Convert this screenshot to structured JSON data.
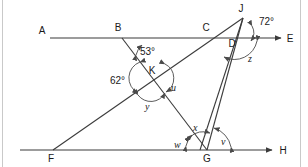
{
  "figure": {
    "points": [
      {
        "name": "A",
        "label": "A",
        "x": 42,
        "y": 38,
        "label_x": 42,
        "label_y": 34
      },
      {
        "name": "B",
        "label": "B",
        "x": 122,
        "y": 38,
        "label_x": 118,
        "label_y": 31
      },
      {
        "name": "C",
        "label": "C",
        "x": 211,
        "y": 38,
        "label_x": 206,
        "label_y": 31
      },
      {
        "name": "D",
        "label": "D",
        "x": 237,
        "y": 38,
        "label_x": 232,
        "label_y": 45
      },
      {
        "name": "E",
        "label": "E",
        "x": 281,
        "y": 38,
        "label_x": 289,
        "label_y": 41
      },
      {
        "name": "J",
        "label": "J",
        "x": 243,
        "y": 18,
        "label_x": 241,
        "label_y": 11
      },
      {
        "name": "K",
        "label": "K",
        "x": 152,
        "y": 77,
        "label_x": 152,
        "label_y": 74
      },
      {
        "name": "F",
        "label": "F",
        "x": 53,
        "y": 150,
        "label_x": 51,
        "label_y": 161
      },
      {
        "name": "G",
        "label": "G",
        "x": 207,
        "y": 150,
        "label_x": 206,
        "label_y": 161
      },
      {
        "name": "H",
        "label": "H",
        "x": 272,
        "y": 150,
        "label_x": 282,
        "label_y": 153
      }
    ],
    "lines": [
      {
        "name": "line-AE",
        "from": "A",
        "to": "E",
        "arrow_end": true,
        "arrow_start": false
      },
      {
        "name": "line-FH",
        "from": "F",
        "to": "H",
        "arrow_end": true,
        "arrow_start": false
      },
      {
        "name": "segment-BG",
        "from": "B",
        "to": "G",
        "arrow_end": false,
        "arrow_start": false
      },
      {
        "name": "segment-FJ",
        "from": "F",
        "to": "J",
        "arrow_end": false,
        "arrow_start": false
      },
      {
        "name": "segment-JG",
        "from": "J",
        "to": "G",
        "arrow_end": false,
        "arrow_start": false
      },
      {
        "name": "segment-JD-G",
        "from": "J",
        "to": "G",
        "arrow_end": false,
        "arrow_start": false
      }
    ],
    "angles": [
      {
        "name": "angle-53-at-B",
        "label": "53°",
        "vertex": "B",
        "label_x": 140,
        "label_y": 52
      },
      {
        "name": "angle-62-at-K",
        "label": "62°",
        "vertex": "K",
        "label_x": 121,
        "label_y": 81
      },
      {
        "name": "angle-u-at-K",
        "label": "u",
        "vertex": "K",
        "label_x": 172,
        "label_y": 88
      },
      {
        "name": "angle-y-at-K",
        "label": "y",
        "vertex": "K",
        "label_x": 147,
        "label_y": 107
      },
      {
        "name": "angle-72-at-J",
        "label": "72°",
        "vertex": "J",
        "label_x": 268,
        "label_y": 25
      },
      {
        "name": "angle-z-at-D",
        "label": "z",
        "vertex": "D",
        "label_x": 250,
        "label_y": 60
      },
      {
        "name": "angle-x-at-G",
        "label": "x",
        "vertex": "G",
        "label_x": 196,
        "label_y": 129
      },
      {
        "name": "angle-w-at-G",
        "label": "w",
        "vertex": "G",
        "label_x": 178,
        "label_y": 146
      },
      {
        "name": "angle-v-at-G",
        "label": "v",
        "vertex": "G",
        "label_x": 224,
        "label_y": 143
      }
    ],
    "colors": {
      "line": "#3b3b3b",
      "arc": "#4a4a4a",
      "label": "#1a1a1a",
      "frame": "#c9c9c9",
      "background": "#ffffff"
    }
  }
}
